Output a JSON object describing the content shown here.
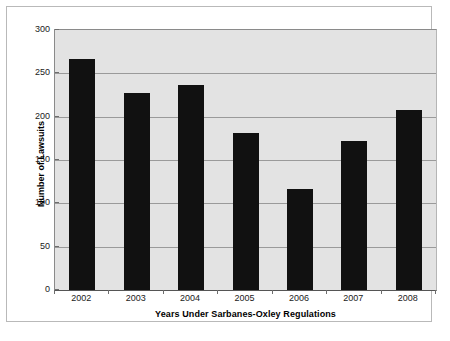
{
  "chart_data": {
    "type": "bar",
    "title": "",
    "xlabel": "Years Under Sarbanes-Oxley Regulations",
    "ylabel": "Number of Lawsuits",
    "categories": [
      "2002",
      "2003",
      "2004",
      "2005",
      "2006",
      "2007",
      "2008"
    ],
    "values": [
      266,
      227,
      236,
      181,
      116,
      172,
      208
    ],
    "ylim": [
      0,
      300
    ],
    "yticks": [
      0,
      50,
      100,
      150,
      200,
      250,
      300
    ],
    "ytick_labels": [
      "0",
      "50",
      "100",
      "150",
      "200",
      "250",
      "300"
    ],
    "grid": "horizontal",
    "legend": "none",
    "bar_color": "#111111",
    "plot_background": "#e3e3e3",
    "gridline_color": "#9a9a9a",
    "figure_background": "#ffffff"
  }
}
